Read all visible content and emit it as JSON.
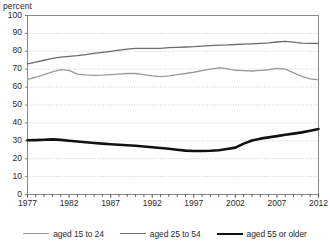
{
  "chart_data": {
    "type": "line",
    "title": "",
    "subtitle": "",
    "xlabel": "",
    "ylabel": "percent",
    "ylim": [
      0,
      100
    ],
    "xlim": [
      1977,
      2012
    ],
    "ytick_step": 10,
    "yticks": [
      100,
      90,
      80,
      70,
      60,
      50,
      40,
      30,
      20,
      10,
      0
    ],
    "xticks_major": [
      1977,
      1982,
      1987,
      1992,
      1997,
      2002,
      2007,
      2012
    ],
    "xticks_minor_every": 1,
    "grid": true,
    "grid_axis": "y",
    "legend_position": "bottom",
    "x": [
      1977,
      1978,
      1979,
      1980,
      1981,
      1982,
      1983,
      1984,
      1985,
      1986,
      1987,
      1988,
      1989,
      1990,
      1991,
      1992,
      1993,
      1994,
      1995,
      1996,
      1997,
      1998,
      1999,
      2000,
      2001,
      2002,
      2003,
      2004,
      2005,
      2006,
      2007,
      2008,
      2009,
      2010,
      2011,
      2012
    ],
    "series": [
      {
        "name": "aged 15 to 24",
        "color": "#9a9a9a",
        "width": 1.3,
        "values": [
          64.3,
          65.5,
          67.0,
          68.5,
          69.8,
          69.3,
          67.2,
          66.8,
          66.6,
          66.7,
          67.0,
          67.3,
          67.6,
          67.6,
          67.0,
          66.3,
          65.8,
          66.3,
          67.0,
          67.6,
          68.3,
          69.2,
          70.0,
          70.8,
          70.3,
          69.4,
          69.2,
          69.0,
          69.3,
          69.7,
          70.4,
          70.0,
          68.0,
          66.0,
          64.6,
          64.0
        ]
      },
      {
        "name": "aged 25 to 54",
        "color": "#6b6b6b",
        "width": 1.3,
        "values": [
          73.0,
          74.0,
          75.0,
          76.0,
          76.7,
          77.2,
          77.6,
          78.2,
          78.8,
          79.4,
          80.0,
          80.6,
          81.2,
          81.6,
          81.6,
          81.6,
          81.6,
          82.0,
          82.2,
          82.4,
          82.6,
          82.9,
          83.2,
          83.5,
          83.6,
          83.8,
          84.0,
          84.2,
          84.4,
          84.7,
          85.2,
          85.5,
          85.1,
          84.6,
          84.4,
          84.4
        ]
      },
      {
        "name": "aged 55 or older",
        "color": "#111111",
        "width": 2.6,
        "values": [
          30.3,
          30.4,
          30.6,
          30.8,
          30.5,
          30.0,
          29.6,
          29.2,
          28.8,
          28.4,
          28.1,
          27.8,
          27.5,
          27.2,
          26.8,
          26.4,
          26.0,
          25.6,
          25.0,
          24.5,
          24.3,
          24.3,
          24.4,
          24.7,
          25.4,
          26.2,
          28.4,
          30.2,
          31.2,
          31.9,
          32.6,
          33.4,
          34.0,
          34.7,
          35.6,
          36.6
        ]
      }
    ]
  }
}
